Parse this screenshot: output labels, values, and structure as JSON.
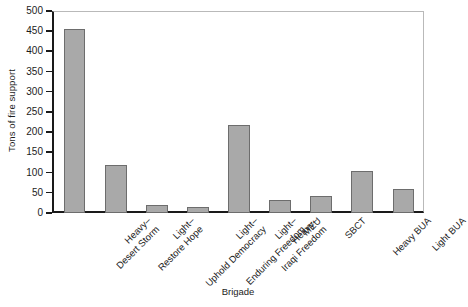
{
  "chart_data": {
    "type": "bar",
    "title": "",
    "xlabel": "Brigade",
    "ylabel": "Tons of fire support",
    "ylim": [
      0,
      500
    ],
    "ytick_step": 50,
    "yticks": [
      0,
      50,
      100,
      150,
      200,
      250,
      300,
      350,
      400,
      450,
      500
    ],
    "grid": false,
    "legend": null,
    "bar_color": "#a9a9a9",
    "bar_edge_color": "#6d6d6d",
    "axis_color": "#1a1a1a",
    "categories": [
      "Heavy– Desert Storm",
      "Light– Restore Hope",
      "Light– Uphold Democracy",
      "Light– Enduring Freedom",
      "Heavy– Iraqi Freedom",
      "MEU",
      "SBCT",
      "Heavy BUA",
      "Light BUA"
    ],
    "category_lines": [
      [
        "Heavy–",
        "Desert Storm"
      ],
      [
        "Light–",
        "Restore Hope"
      ],
      [
        "Light–",
        "Uphold Democracy"
      ],
      [
        "Light–",
        "Enduring Freedom"
      ],
      [
        "Heavy–",
        "Iraqi Freedom"
      ],
      [
        "MEU",
        ""
      ],
      [
        "SBCT",
        ""
      ],
      [
        "Heavy BUA",
        ""
      ],
      [
        "Light BUA",
        ""
      ]
    ],
    "values": [
      455,
      118,
      20,
      14,
      217,
      33,
      42,
      103,
      60
    ]
  }
}
